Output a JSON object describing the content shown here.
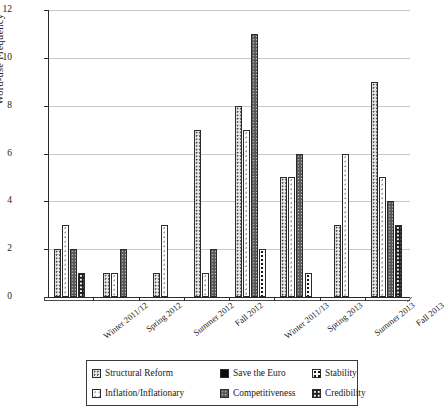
{
  "chart_data": {
    "type": "bar",
    "title": "",
    "xlabel": "",
    "ylabel": "Word-use Frequency",
    "ylim": [
      0,
      12
    ],
    "yticks": [
      0,
      2,
      4,
      6,
      8,
      10,
      12
    ],
    "grid": true,
    "legend_position": "bottom",
    "categories": [
      "Winter 2011/12",
      "Spring 2012",
      "Summer 2012",
      "Fall 2012",
      "Winter 2011/13",
      "Spring 2013",
      "Summer 2013",
      "Fall 2013"
    ],
    "series": [
      {
        "name": "Structural Reform",
        "pattern": "p-structural",
        "values": [
          2,
          1,
          1,
          7,
          8,
          5,
          3,
          9
        ]
      },
      {
        "name": "Inflation/Inflationary",
        "pattern": "p-inflation",
        "values": [
          3,
          1,
          3,
          1,
          7,
          5,
          6,
          5
        ]
      },
      {
        "name": "Save the Euro",
        "pattern": "p-saveeuro",
        "values": [
          0,
          0,
          0,
          0,
          0,
          0,
          0,
          0
        ]
      },
      {
        "name": "Competitiveness",
        "pattern": "p-competitiveness",
        "values": [
          2,
          2,
          0,
          2,
          11,
          6,
          0,
          4
        ]
      },
      {
        "name": "Stability",
        "pattern": "p-stability",
        "values": [
          0,
          0,
          0,
          0,
          2,
          1,
          0,
          0
        ]
      },
      {
        "name": "Credibility",
        "pattern": "p-credibility",
        "values": [
          1,
          0,
          0,
          0,
          0,
          0,
          0,
          3
        ]
      }
    ]
  },
  "legend": {
    "items": [
      {
        "label": "Structural Reform",
        "pattern": "p-structural"
      },
      {
        "label": "Save the Euro",
        "pattern": "p-saveeuro"
      },
      {
        "label": "Stability",
        "pattern": "p-stability"
      },
      {
        "label": "Inflation/Inflationary",
        "pattern": "p-inflation"
      },
      {
        "label": "Competitiveness",
        "pattern": "p-competitiveness"
      },
      {
        "label": "Credibility",
        "pattern": "p-credibility"
      }
    ]
  },
  "colors": {
    "axis": "#2a2a2a",
    "grid": "#c9c9c9",
    "text": "#1a1a1a"
  }
}
